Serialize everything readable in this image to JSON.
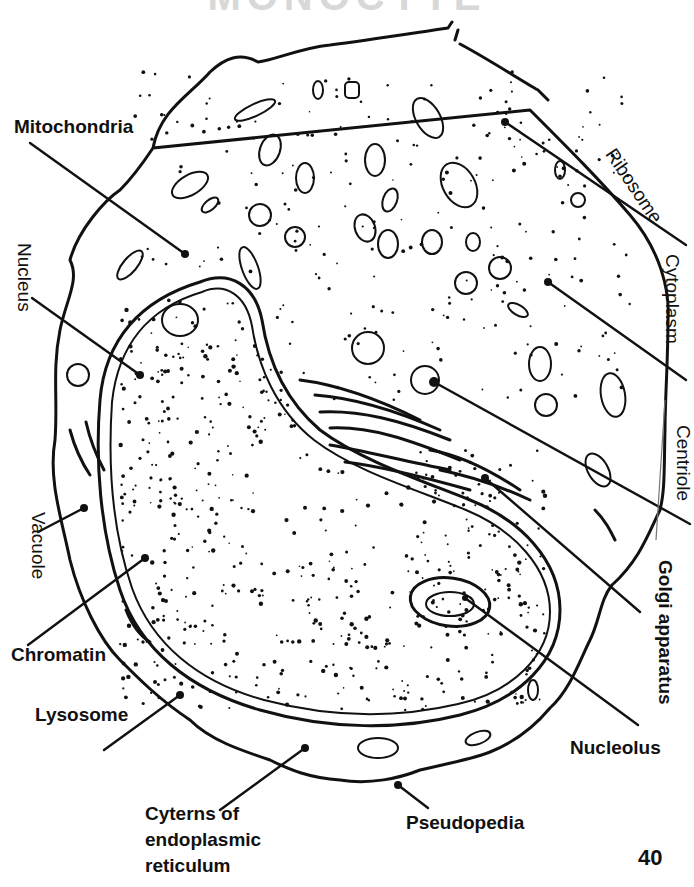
{
  "diagram": {
    "title_clipped": "MONOCYTE",
    "page_number": "40",
    "labels": [
      {
        "id": "mitochondria",
        "text": "Mitochondria",
        "orientation": "horizontal"
      },
      {
        "id": "nucleus",
        "text": "Nucleus",
        "orientation": "vertical"
      },
      {
        "id": "vacuole",
        "text": "Vacuole",
        "orientation": "vertical"
      },
      {
        "id": "chromatin",
        "text": "Chromatin",
        "orientation": "horizontal"
      },
      {
        "id": "lysosome",
        "text": "Lysosome",
        "orientation": "horizontal"
      },
      {
        "id": "er",
        "text": "Cyterns of endoplasmic reticulum",
        "lines": [
          "Cyterns of",
          "endoplasmic",
          "reticulum"
        ],
        "orientation": "horizontal"
      },
      {
        "id": "pseudopedia",
        "text": "Pseudopedia",
        "orientation": "horizontal"
      },
      {
        "id": "nucleolus",
        "text": "Nucleolus",
        "orientation": "horizontal"
      },
      {
        "id": "golgi",
        "text": "Golgi apparatus",
        "orientation": "vertical"
      },
      {
        "id": "centriole",
        "text": "Centriole",
        "orientation": "vertical"
      },
      {
        "id": "cytoplasm",
        "text": "Cytoplasm",
        "orientation": "vertical"
      },
      {
        "id": "ribosome",
        "text": "Ribosome",
        "orientation": "diagonal"
      }
    ],
    "colors": {
      "ink": "#111111",
      "background": "#ffffff"
    }
  }
}
